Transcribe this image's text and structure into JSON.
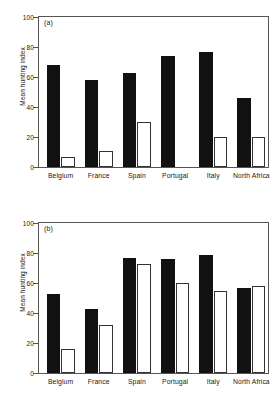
{
  "figure": {
    "background": "#ffffff",
    "dark_color": "#111111",
    "light_color": "#ffffff",
    "light_edge_color": "#333333",
    "axis_color": "#555555"
  },
  "panels": [
    {
      "tag": "(a)",
      "ylabel": "Mean hunting index",
      "yticks": [
        "0",
        "20",
        "40",
        "60",
        "80",
        "100"
      ]
    },
    {
      "tag": "(b)",
      "ylabel": "Mean hunting index",
      "yticks": [
        "0",
        "20",
        "40",
        "60",
        "80",
        "100"
      ]
    }
  ],
  "categories": [
    "Belgium",
    "France",
    "Spain",
    "Portugal",
    "Italy",
    "North Africa"
  ],
  "chart_data": [
    {
      "type": "bar",
      "title": "(a)",
      "xlabel": "",
      "ylabel": "Mean hunting index",
      "categories": [
        "Belgium",
        "France",
        "Spain",
        "Portugal",
        "Italy",
        "North Africa"
      ],
      "series": [
        {
          "name": "filled",
          "values": [
            68,
            58,
            63,
            74,
            77,
            46
          ]
        },
        {
          "name": "open",
          "values": [
            7,
            11,
            30,
            0,
            20,
            20
          ]
        }
      ],
      "ylim": [
        0,
        100
      ],
      "yticks": [
        0,
        20,
        40,
        60,
        80,
        100
      ],
      "grid": false,
      "legend": "none"
    },
    {
      "type": "bar",
      "title": "(b)",
      "xlabel": "",
      "ylabel": "Mean hunting index",
      "categories": [
        "Belgium",
        "France",
        "Spain",
        "Portugal",
        "Italy",
        "North Africa"
      ],
      "series": [
        {
          "name": "filled",
          "values": [
            53,
            43,
            77,
            76,
            79,
            57
          ]
        },
        {
          "name": "open",
          "values": [
            16,
            32,
            73,
            60,
            55,
            58
          ]
        }
      ],
      "ylim": [
        0,
        100
      ],
      "yticks": [
        0,
        20,
        40,
        60,
        80,
        100
      ],
      "grid": false,
      "legend": "none"
    }
  ]
}
